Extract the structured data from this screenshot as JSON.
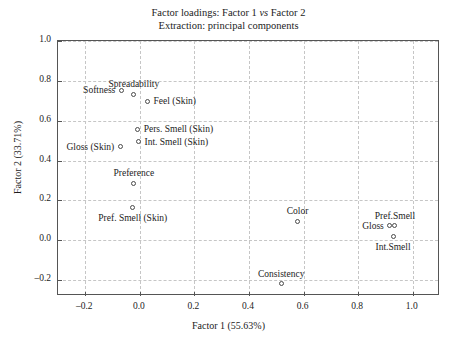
{
  "chart_data": {
    "type": "scatter",
    "title": "Factor loadings: Factor 1 vs Factor 2",
    "subtitle": "Extraction: principal components",
    "title_prefix": "Factor loadings: Factor 1 ",
    "title_italic": "vs",
    "title_suffix": " Factor 2",
    "xlabel": "Factor 1 (55.63%)",
    "ylabel": "Factor 2 (33.71%)",
    "xlim": [
      -0.3,
      1.1
    ],
    "ylim": [
      -0.28,
      1.0
    ],
    "xticks": [
      -0.2,
      0.0,
      0.2,
      0.4,
      0.6,
      0.8,
      1.0
    ],
    "yticks": [
      -0.2,
      0.0,
      0.2,
      0.4,
      0.6,
      0.8,
      1.0
    ],
    "xtick_labels": [
      "–0.2",
      "0.0",
      "0.2",
      "0.4",
      "0.6",
      "0.8",
      "1.0"
    ],
    "ytick_labels": [
      "–0.2",
      "0.0",
      "0.2",
      "0.4",
      "0.6",
      "0.8",
      "1.0"
    ],
    "grid": true,
    "grid_style": "dashed",
    "legend": "none",
    "marker_style": "open-circle",
    "marker_color": "#4a4a4a",
    "grid_color": "#c6c6c6",
    "frame_color": "#555555",
    "points": [
      {
        "label": "Softness",
        "x": -0.068,
        "y": 0.752,
        "label_pos": "left"
      },
      {
        "label": "Spreadability",
        "x": -0.022,
        "y": 0.733,
        "label_pos": "above"
      },
      {
        "label": "Feel (Skin)",
        "x": 0.028,
        "y": 0.697,
        "label_pos": "right"
      },
      {
        "label": "Pers. Smell (Skin)",
        "x": -0.008,
        "y": 0.556,
        "label_pos": "right"
      },
      {
        "label": "Int. Smell (Skin)",
        "x": -0.005,
        "y": 0.494,
        "label_pos": "right"
      },
      {
        "label": "Gloss (Skin)",
        "x": -0.072,
        "y": 0.47,
        "label_pos": "left"
      },
      {
        "label": "Preference",
        "x": -0.022,
        "y": 0.287,
        "label_pos": "above"
      },
      {
        "label": "Pref. Smell (Skin)",
        "x": -0.026,
        "y": 0.163,
        "label_pos": "below"
      },
      {
        "label": "Color",
        "x": 0.578,
        "y": 0.095,
        "label_pos": "above"
      },
      {
        "label": "Gloss",
        "x": 0.916,
        "y": 0.072,
        "label_pos": "left"
      },
      {
        "label": "Pref.Smell",
        "x": 0.935,
        "y": 0.072,
        "label_pos": "above"
      },
      {
        "label": "Int.Smell",
        "x": 0.928,
        "y": 0.018,
        "label_pos": "below"
      },
      {
        "label": "Consistency",
        "x": 0.518,
        "y": -0.218,
        "label_pos": "above"
      }
    ]
  }
}
